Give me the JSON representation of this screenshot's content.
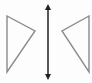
{
  "diagram": {
    "title": "Reflection symmetry across a vertical line",
    "colors": {
      "background": "#fdfdfd",
      "triangle_stroke": "#8a8a8a",
      "axis_stroke": "#222222"
    },
    "left_triangle": {
      "points": "7,16 35,31 7,72"
    },
    "right_triangle": {
      "points": "89,16 62,31 89,72"
    },
    "mirror_line": {
      "x": 48,
      "y1": 4,
      "y2": 80,
      "arrowheads": "both"
    }
  }
}
